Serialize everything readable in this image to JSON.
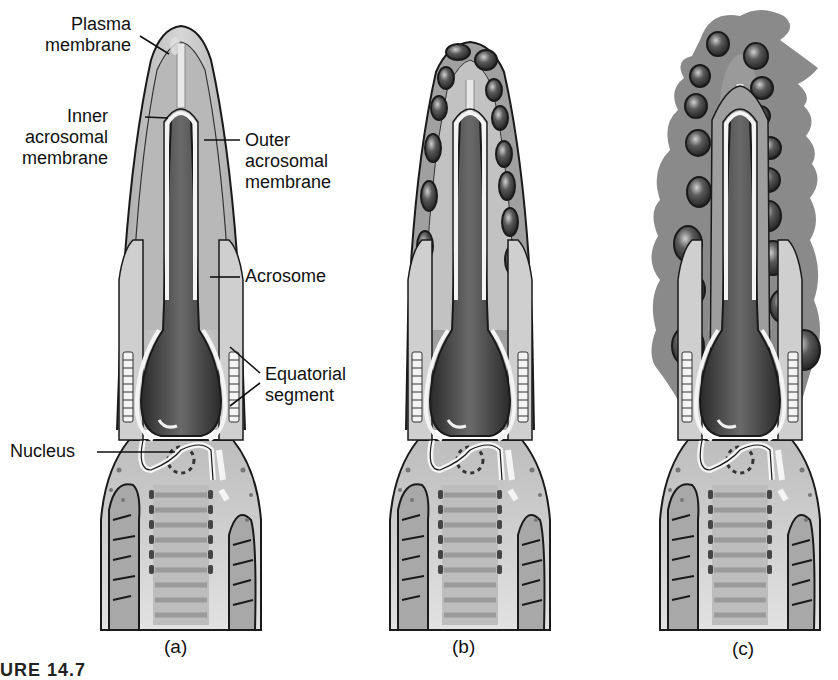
{
  "figure": {
    "caption_partial": "URE 14.7",
    "panels": [
      {
        "id": "a",
        "label": "(a)"
      },
      {
        "id": "b",
        "label": "(b)"
      },
      {
        "id": "c",
        "label": "(c)"
      }
    ],
    "labels": {
      "plasma_membrane": [
        "Plasma",
        "membrane"
      ],
      "inner_acrosomal_membrane": [
        "Inner",
        "acrosomal",
        "membrane"
      ],
      "outer_acrosomal_membrane": [
        "Outer",
        "acrosomal",
        "membrane"
      ],
      "acrosome": [
        "Acrosome"
      ],
      "equatorial_segment": [
        "Equatorial",
        "segment"
      ],
      "nucleus": [
        "Nucleus"
      ]
    },
    "colors": {
      "outline": "#1a1a1a",
      "light_fill": "#c8c8c8",
      "mid_fill": "#8e8e8e",
      "dark_fill": "#3a3a3a",
      "membrane_white": "#f4f4f4",
      "vesicle_fill": "#7a7a7a"
    }
  }
}
